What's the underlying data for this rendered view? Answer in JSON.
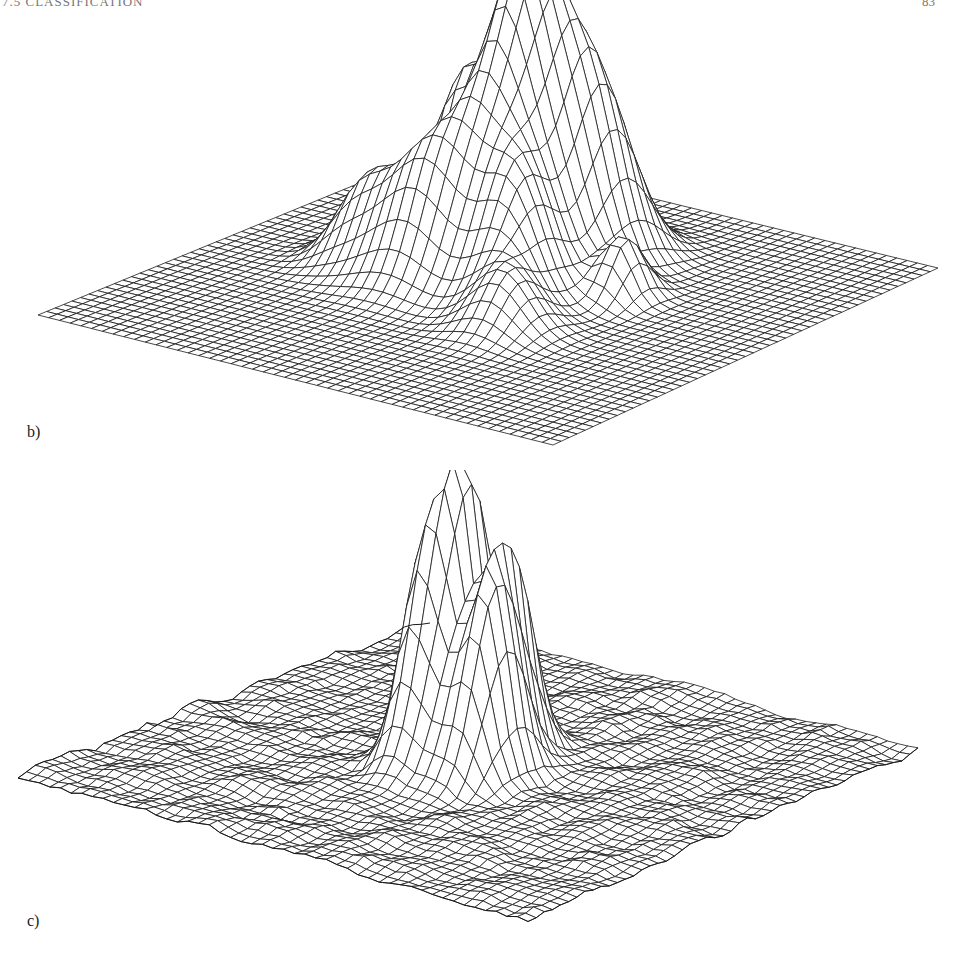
{
  "page": {
    "header_section": "7.5  CLASSIFICATION",
    "header_page_number": "83"
  },
  "figure": {
    "panels": [
      {
        "label": "b)",
        "description": "3D wireframe surface plot with a smooth multi-peaked central region on a flat square grid",
        "grid": 48,
        "corners": {
          "left": [
            38,
            315
          ],
          "bottom": [
            553,
            445
          ],
          "right": [
            938,
            268
          ],
          "back": [
            445,
            148
          ]
        },
        "height_scale": 1.0,
        "noise": 0.0,
        "peaks": [
          {
            "u": 0.45,
            "v": 0.36,
            "h": 300,
            "sx": 0.055,
            "sy": 0.085
          },
          {
            "u": 0.3,
            "v": 0.3,
            "h": 170,
            "sx": 0.06,
            "sy": 0.06
          },
          {
            "u": 0.55,
            "v": 0.3,
            "h": 160,
            "sx": 0.05,
            "sy": 0.07
          },
          {
            "u": 0.38,
            "v": 0.52,
            "h": 120,
            "sx": 0.07,
            "sy": 0.06
          },
          {
            "u": 0.55,
            "v": 0.5,
            "h": 110,
            "sx": 0.05,
            "sy": 0.06
          },
          {
            "u": 0.25,
            "v": 0.5,
            "h": 70,
            "sx": 0.05,
            "sy": 0.05
          },
          {
            "u": 0.68,
            "v": 0.4,
            "h": 60,
            "sx": 0.03,
            "sy": 0.04
          },
          {
            "u": 0.62,
            "v": 0.62,
            "h": 55,
            "sx": 0.05,
            "sy": 0.05
          }
        ]
      },
      {
        "label": "c)",
        "description": "3D wireframe surface plot with sharp tall spikes at the center over a noisy rippled grid",
        "grid": 48,
        "corners": {
          "left": [
            18,
            305
          ],
          "bottom": [
            528,
            450
          ],
          "right": [
            918,
            278
          ],
          "back": [
            430,
            150
          ]
        },
        "height_scale": 1.0,
        "noise": 7,
        "peaks": [
          {
            "u": 0.47,
            "v": 0.47,
            "h": 250,
            "sx": 0.022,
            "sy": 0.05
          },
          {
            "u": 0.4,
            "v": 0.45,
            "h": 190,
            "sx": 0.025,
            "sy": 0.05
          },
          {
            "u": 0.53,
            "v": 0.44,
            "h": 180,
            "sx": 0.022,
            "sy": 0.05
          },
          {
            "u": 0.56,
            "v": 0.52,
            "h": 160,
            "sx": 0.03,
            "sy": 0.05
          },
          {
            "u": 0.43,
            "v": 0.53,
            "h": 150,
            "sx": 0.025,
            "sy": 0.05
          },
          {
            "u": 0.48,
            "v": 0.56,
            "h": 90,
            "sx": 0.05,
            "sy": 0.05
          }
        ]
      }
    ]
  }
}
